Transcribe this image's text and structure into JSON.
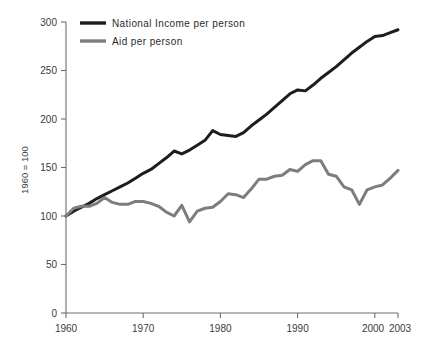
{
  "chart_data": {
    "type": "line",
    "title": "",
    "subtitle": "",
    "xlabel": "",
    "ylabel": "1960 = 100",
    "xlim": [
      1960,
      2003
    ],
    "ylim": [
      0,
      300
    ],
    "grid": false,
    "legend_position": "top-left",
    "x_ticks": [
      "1960",
      "1970",
      "1980",
      "1990",
      "2000",
      "2003"
    ],
    "x_tick_values": [
      1960,
      1970,
      1980,
      1990,
      2000,
      2003
    ],
    "y_ticks": [
      "0",
      "50",
      "100",
      "150",
      "200",
      "250",
      "300"
    ],
    "y_tick_values": [
      0,
      50,
      100,
      150,
      200,
      250,
      300
    ],
    "x": [
      1960,
      1961,
      1962,
      1963,
      1964,
      1965,
      1966,
      1967,
      1968,
      1969,
      1970,
      1971,
      1972,
      1973,
      1974,
      1975,
      1976,
      1977,
      1978,
      1979,
      1980,
      1981,
      1982,
      1983,
      1984,
      1985,
      1986,
      1987,
      1988,
      1989,
      1990,
      1991,
      1992,
      1993,
      1994,
      1995,
      1996,
      1997,
      1998,
      1999,
      2000,
      2001,
      2002,
      2003
    ],
    "series": [
      {
        "name": "National Income per person",
        "color": "#1d1d1d",
        "line_width": 3.0,
        "values": [
          100,
          105,
          109,
          113,
          118,
          122,
          126,
          130,
          134,
          139,
          144,
          148,
          154,
          160,
          167,
          164,
          168,
          173,
          178,
          188,
          184,
          183,
          182,
          186,
          193,
          199,
          205,
          212,
          219,
          226,
          230,
          229,
          235,
          242,
          248,
          254,
          261,
          268,
          274,
          280,
          285,
          286,
          289,
          292
        ]
      },
      {
        "name": "Aid per person",
        "color": "#7d7d7d",
        "line_width": 3.0,
        "values": [
          100,
          108,
          110,
          110,
          113,
          119,
          114,
          112,
          112,
          115,
          115,
          113,
          110,
          104,
          100,
          111,
          94,
          105,
          108,
          109,
          115,
          123,
          122,
          119,
          128,
          138,
          138,
          141,
          142,
          148,
          146,
          153,
          157,
          157,
          143,
          141,
          130,
          127,
          112,
          127,
          130,
          132,
          139,
          147
        ]
      }
    ],
    "legend": [
      {
        "label": "National Income per person",
        "color": "#1d1d1d"
      },
      {
        "label": "Aid per person",
        "color": "#7d7d7d"
      }
    ]
  }
}
